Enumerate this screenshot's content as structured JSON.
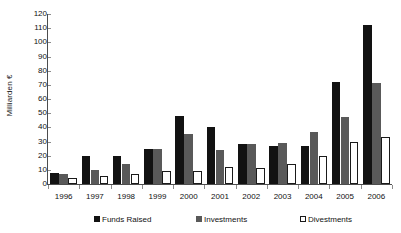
{
  "chart_data": {
    "type": "bar",
    "title": "",
    "subtitle": "",
    "xlabel": "",
    "ylabel": "Milliarden €",
    "ylim": [
      0,
      120
    ],
    "ytick_step": 10,
    "yticks": [
      "120",
      "110",
      "100",
      "90",
      "80",
      "70",
      "60",
      "50",
      "40",
      "30",
      "20",
      "10",
      "0"
    ],
    "grid": false,
    "legend_position": "bottom",
    "categories": [
      "1996",
      "1997",
      "1998",
      "1999",
      "2000",
      "2001",
      "2002",
      "2003",
      "2004",
      "2005",
      "2006"
    ],
    "series": [
      {
        "name": "Funds Raised",
        "color": "#121212",
        "values": [
          8,
          20,
          20,
          25,
          48,
          40,
          28,
          27,
          27,
          72,
          112
        ]
      },
      {
        "name": "Investments",
        "color": "#595959",
        "values": [
          7,
          10,
          14,
          25,
          35,
          24,
          28,
          29,
          37,
          47,
          71
        ]
      },
      {
        "name": "Divestments",
        "color": "#ffffff",
        "values": [
          4,
          6,
          7,
          9,
          9,
          12,
          11,
          14,
          20,
          30,
          33
        ]
      }
    ]
  },
  "legend": {
    "items": [
      {
        "label": "Funds Raised",
        "swatch": "black-square-icon"
      },
      {
        "label": "Investments",
        "swatch": "gray-square-icon"
      },
      {
        "label": "Divestments",
        "swatch": "white-square-icon"
      }
    ]
  },
  "axes": {
    "y_title": "Milliarden €"
  },
  "colors": {
    "funds_raised": "#121212",
    "investments": "#595959",
    "divestments": "#ffffff",
    "axis": "#4d4d4d",
    "background": "#ffffff",
    "text": "#111111"
  }
}
